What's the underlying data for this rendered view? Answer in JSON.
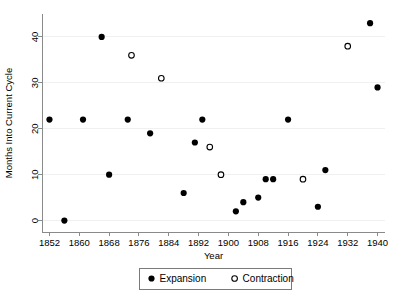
{
  "chart_data": {
    "type": "scatter",
    "title": "",
    "xlabel": "Year",
    "ylabel": "Months Into Current Cycle",
    "xlim": [
      1850,
      1942
    ],
    "ylim": [
      -2.5,
      45
    ],
    "grid": true,
    "legend_position": "bottom-center",
    "xticks": [
      1852,
      1860,
      1868,
      1876,
      1884,
      1892,
      1900,
      1908,
      1916,
      1924,
      1932,
      1940
    ],
    "xticklabels": [
      "1852",
      "1860",
      "1868",
      "1876",
      "1884",
      "1892",
      "1900",
      "1908",
      "1916",
      "1924",
      "1932",
      "1940"
    ],
    "yticks": [
      0,
      10,
      20,
      30,
      40
    ],
    "yticklabels": [
      "0",
      "10",
      "20",
      "30",
      "40"
    ],
    "series": [
      {
        "name": "Expansion",
        "marker": "filled-circle",
        "color": "#000000",
        "points": [
          {
            "x": 1852,
            "y": 22
          },
          {
            "x": 1856,
            "y": 0
          },
          {
            "x": 1861,
            "y": 22
          },
          {
            "x": 1866,
            "y": 40
          },
          {
            "x": 1868,
            "y": 10
          },
          {
            "x": 1873,
            "y": 22
          },
          {
            "x": 1879,
            "y": 19
          },
          {
            "x": 1888,
            "y": 6
          },
          {
            "x": 1891,
            "y": 17
          },
          {
            "x": 1893,
            "y": 22
          },
          {
            "x": 1902,
            "y": 2
          },
          {
            "x": 1904,
            "y": 4
          },
          {
            "x": 1908,
            "y": 5
          },
          {
            "x": 1910,
            "y": 9
          },
          {
            "x": 1912,
            "y": 9
          },
          {
            "x": 1916,
            "y": 22
          },
          {
            "x": 1924,
            "y": 3
          },
          {
            "x": 1926,
            "y": 11
          },
          {
            "x": 1938,
            "y": 43
          },
          {
            "x": 1940,
            "y": 29
          }
        ]
      },
      {
        "name": "Contraction",
        "marker": "open-circle",
        "color": "#000000",
        "points": [
          {
            "x": 1874,
            "y": 36
          },
          {
            "x": 1882,
            "y": 31
          },
          {
            "x": 1895,
            "y": 16
          },
          {
            "x": 1898,
            "y": 10
          },
          {
            "x": 1920,
            "y": 9
          },
          {
            "x": 1932,
            "y": 38
          }
        ]
      }
    ]
  },
  "legend": {
    "items": [
      {
        "label": "Expansion",
        "marker": "filled-circle"
      },
      {
        "label": "Contraction",
        "marker": "open-circle"
      }
    ]
  }
}
